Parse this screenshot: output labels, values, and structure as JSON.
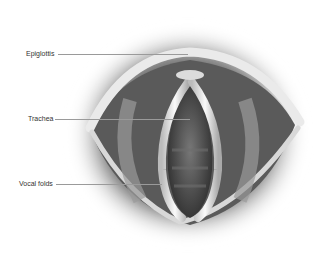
{
  "diagram": {
    "labels": [
      {
        "id": "epiglottis",
        "text": "Epiglottis"
      },
      {
        "id": "trachea",
        "text": "Trachea"
      },
      {
        "id": "vocal-folds",
        "text": "Vocal folds"
      }
    ]
  }
}
